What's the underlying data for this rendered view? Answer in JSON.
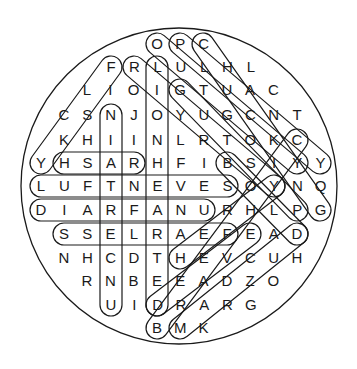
{
  "puzzle": {
    "type": "word-search",
    "shape": "circle",
    "colors": {
      "ink": "#1a1a1a",
      "background": "#ffffff"
    },
    "rows": [
      {
        "y": 44,
        "x0": 157,
        "letters": "OPC"
      },
      {
        "y": 67,
        "x0": 111,
        "letters": "FRLULHL"
      },
      {
        "y": 90,
        "x0": 87,
        "letters": "LIOIGTUAC"
      },
      {
        "y": 115,
        "x0": 64,
        "letters": "CSNJOYUGCNT"
      },
      {
        "y": 140,
        "x0": 64,
        "letters": "KHIINLRTOKC"
      },
      {
        "y": 163,
        "x0": 41,
        "letters": "YHSARHFIBSIYY"
      },
      {
        "y": 186,
        "x0": 41,
        "letters": "LUFTNEVESOYNQ"
      },
      {
        "y": 210,
        "x0": 41,
        "letters": "DIARFANURHLPG"
      },
      {
        "y": 234,
        "x0": 64,
        "letters": "SSELRAEFEAD"
      },
      {
        "y": 258,
        "x0": 64,
        "letters": "NHCDTHEVCUH"
      },
      {
        "y": 281,
        "x0": 87,
        "letters": "RNBEEADZO"
      },
      {
        "y": 305,
        "x0": 111,
        "letters": "UIDRARG"
      },
      {
        "y": 328,
        "x0": 157,
        "letters": "BMK"
      }
    ],
    "col_spacing": 23.3,
    "found_words": [
      {
        "word": "LIONHEARTED",
        "from": [
          157,
          67
        ],
        "to": [
          157,
          305
        ]
      },
      {
        "word": "UNCERTAIN",
        "from": [
          111,
          305
        ],
        "to": [
          111,
          115
        ]
      },
      {
        "word": "LUFTNEVE",
        "from": [
          41,
          186
        ],
        "to": [
          227,
          186
        ]
      },
      {
        "word": "DIARFANU",
        "from": [
          41,
          210
        ],
        "to": [
          204,
          210
        ]
      },
      {
        "word": "SSELRAEF",
        "from": [
          64,
          234
        ],
        "to": [
          227,
          234
        ]
      },
      {
        "word": "HSAR",
        "from": [
          64,
          163
        ],
        "to": [
          134,
          163
        ]
      },
      {
        "word": "",
        "from": [
          41,
          163
        ],
        "to": [
          111,
          67
        ]
      },
      {
        "word": "",
        "from": [
          134,
          67
        ],
        "to": [
          274,
          186
        ]
      },
      {
        "word": "",
        "from": [
          157,
          44
        ],
        "to": [
          297,
          163
        ]
      },
      {
        "word": "",
        "from": [
          180,
          44
        ],
        "to": [
          320,
          163
        ]
      },
      {
        "word": "",
        "from": [
          203,
          44
        ],
        "to": [
          320,
          210
        ]
      },
      {
        "word": "",
        "from": [
          180,
          90
        ],
        "to": [
          297,
          210
        ]
      },
      {
        "word": "",
        "from": [
          227,
          163
        ],
        "to": [
          297,
          234
        ]
      },
      {
        "word": "",
        "from": [
          157,
          328
        ],
        "to": [
          297,
          140
        ]
      },
      {
        "word": "",
        "from": [
          180,
          328
        ],
        "to": [
          297,
          234
        ]
      },
      {
        "word": "",
        "from": [
          157,
          305
        ],
        "to": [
          250,
          234
        ]
      },
      {
        "word": "",
        "from": [
          180,
          258
        ],
        "to": [
          274,
          186
        ]
      }
    ]
  }
}
